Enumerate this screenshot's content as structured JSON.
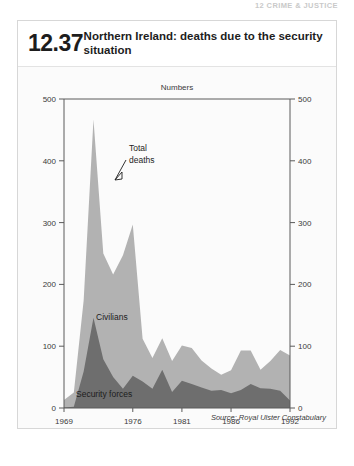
{
  "running_header": "12 CRIME & JUSTICE",
  "figure": {
    "number": "12.37",
    "title": "Northern Ireland: deaths due to the security situation",
    "units_label": "Numbers",
    "source": "Source: Royal Ulster Constabulary"
  },
  "annotations": {
    "total_deaths": "Total deaths",
    "civilians": "Civilians",
    "security_forces": "Security forces"
  },
  "colors": {
    "civilians": "#b2b2b2",
    "security_forces": "#6e6e6e",
    "axis": "#5a5a5a",
    "panel_bg": "#fbfbfb",
    "text": "#1d1d1d"
  },
  "chart_data": {
    "type": "area",
    "stacked": true,
    "title": "Northern Ireland: deaths due to the security situation",
    "subtitle": "Numbers",
    "xlabel": "",
    "ylabel": "Numbers",
    "ylim": [
      0,
      500
    ],
    "yticks": [
      0,
      100,
      200,
      300,
      400,
      500
    ],
    "xlim": [
      1969,
      1992
    ],
    "xticks": [
      1969,
      1976,
      1981,
      1986,
      1992
    ],
    "xtick_labels": [
      "1969",
      "1976",
      "1981",
      "1986",
      "1992"
    ],
    "grid": false,
    "legend": "inline-annotations",
    "dual_y_axis": true,
    "x": [
      1969,
      1970,
      1971,
      1972,
      1973,
      1974,
      1975,
      1976,
      1977,
      1978,
      1979,
      1980,
      1981,
      1982,
      1983,
      1984,
      1985,
      1986,
      1987,
      1988,
      1989,
      1990,
      1991,
      1992
    ],
    "series": [
      {
        "name": "Security forces",
        "color": "#6e6e6e",
        "values": [
          1,
          2,
          59,
          146,
          79,
          50,
          31,
          52,
          43,
          31,
          62,
          26,
          44,
          39,
          33,
          28,
          29,
          24,
          29,
          39,
          32,
          31,
          28,
          12
        ]
      },
      {
        "name": "Civilians",
        "color": "#b2b2b2",
        "values": [
          12,
          23,
          115,
          321,
          171,
          166,
          216,
          245,
          69,
          50,
          51,
          50,
          57,
          58,
          44,
          36,
          25,
          37,
          64,
          54,
          30,
          45,
          66,
          73
        ]
      }
    ],
    "total_deaths": [
      13,
      25,
      174,
      467,
      250,
      216,
      247,
      297,
      112,
      81,
      113,
      76,
      101,
      97,
      77,
      64,
      54,
      61,
      93,
      93,
      62,
      76,
      94,
      85
    ],
    "annotations": [
      {
        "text": "Total deaths",
        "points_to_year": 1973,
        "kind": "leader-arrow"
      },
      {
        "text": "Civilians",
        "kind": "area-label"
      },
      {
        "text": "Security forces",
        "kind": "area-label"
      }
    ]
  }
}
